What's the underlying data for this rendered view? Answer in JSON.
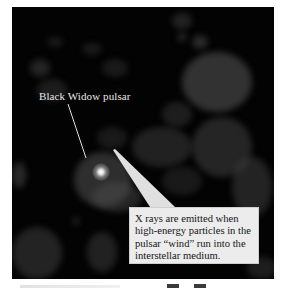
{
  "figure": {
    "type": "astronomical grayscale image with annotations",
    "background_color": "#030303",
    "annotations": {
      "pulsar_label": "Black Widow pulsar",
      "callout_lines": [
        "X rays are emitted when",
        "high-energy particles in the",
        "pulsar “wind” run into the",
        "interstellar medium."
      ]
    },
    "colors": {
      "label_text": "#e8e8e8",
      "callout_bg": "#ececec",
      "callout_text": "#151515",
      "pointer": "#e0e0e0"
    }
  }
}
